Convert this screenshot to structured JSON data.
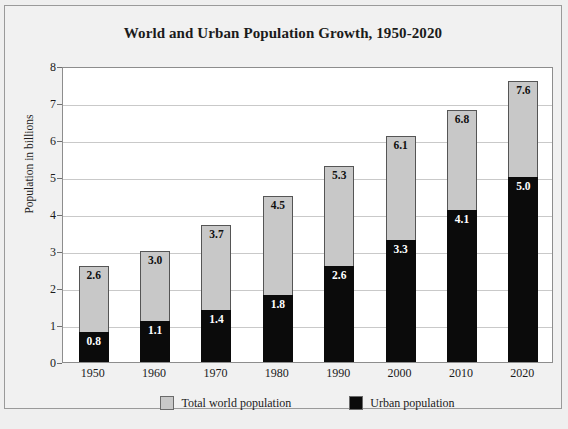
{
  "chart_data": {
    "type": "bar",
    "subtype": "overlaid-stacked",
    "title": "World and Urban Population Growth, 1950-2020",
    "xlabel": "",
    "ylabel": "Population in billions",
    "categories": [
      "1950",
      "1960",
      "1970",
      "1980",
      "1990",
      "2000",
      "2010",
      "2020"
    ],
    "series": [
      {
        "name": "Total world population",
        "color": "#c8c8c8",
        "values": [
          2.6,
          3.0,
          3.7,
          4.5,
          5.3,
          6.1,
          6.8,
          7.6
        ],
        "labels": [
          "2.6",
          "3.0",
          "3.7",
          "4.5",
          "5.3",
          "6.1",
          "6.8",
          "7.6"
        ]
      },
      {
        "name": "Urban population",
        "color": "#0b0b0b",
        "values": [
          0.8,
          1.1,
          1.4,
          1.8,
          2.6,
          3.3,
          4.1,
          5.0
        ],
        "labels": [
          "0.8",
          "1.1",
          "1.4",
          "1.8",
          "2.6",
          "3.3",
          "4.1",
          "5.0"
        ]
      }
    ],
    "ylim": [
      0,
      8
    ],
    "yticks": [
      0,
      1,
      2,
      3,
      4,
      5,
      6,
      7,
      8
    ],
    "ytick_labels": [
      "0",
      "1",
      "2",
      "3",
      "4",
      "5",
      "6",
      "7",
      "8"
    ],
    "grid": true,
    "grid_axis": "y",
    "legend_position": "bottom"
  },
  "figure": {
    "title": "World and Urban Population Growth, 1950-2020",
    "y_axis_title": "Population in billions",
    "caption": ""
  },
  "legend": {
    "items": [
      {
        "label": "Total world population",
        "color": "#c8c8c8"
      },
      {
        "label": "Urban population",
        "color": "#0b0b0b"
      }
    ]
  },
  "colors": {
    "page_background": "#efefef",
    "frame_background": "#f1f1f1",
    "plot_background": "#ffffff",
    "gridline": "#c9c9c9",
    "total_bar": "#c8c8c8",
    "urban_bar": "#0b0b0b",
    "text": "#1b1b1b"
  }
}
